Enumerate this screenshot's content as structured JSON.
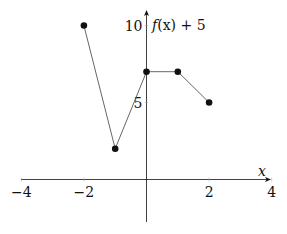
{
  "chart_data": {
    "type": "line",
    "title": "",
    "xlabel": "x",
    "ylabel": "f(x) + 5",
    "xlim": [
      -4,
      4
    ],
    "ylim": [
      -3,
      11
    ],
    "x_ticks": [
      -4,
      -2,
      2,
      4
    ],
    "x_tick_labels": [
      "−4",
      "−2",
      "2",
      "4"
    ],
    "y_ticks": [
      5,
      10
    ],
    "y_tick_labels": [
      "5",
      "10"
    ],
    "grid": false,
    "legend": null,
    "series": [
      {
        "name": "f(x) + 5",
        "x": [
          -2,
          -1,
          0,
          1,
          2
        ],
        "values": [
          10,
          2,
          7,
          7,
          5
        ],
        "markers": true,
        "color": "#222222"
      }
    ]
  },
  "labels": {
    "xlabel": "x",
    "ylabel_f": "f",
    "ylabel_rest": "(x) + 5"
  },
  "colors": {
    "axis": "#111111",
    "line": "#555555",
    "marker": "#111111"
  }
}
